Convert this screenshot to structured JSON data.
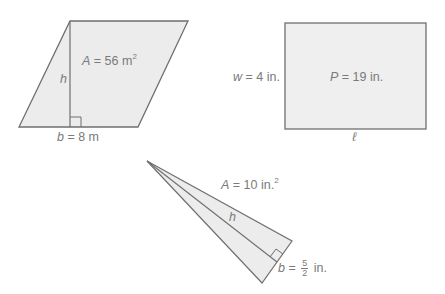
{
  "colors": {
    "fill": "#ececec",
    "stroke": "#6f6f6f",
    "text": "#7a7a7a",
    "background": "#ffffff"
  },
  "figures": {
    "parallelogram": {
      "shape": "parallelogram",
      "area_label": {
        "var": "A",
        "eq": " = 56 m",
        "sup": "2"
      },
      "height_label": "h",
      "base_label": {
        "var": "b",
        "eq": " = 8 m"
      }
    },
    "rectangle": {
      "shape": "rectangle",
      "perimeter_label": {
        "var": "P",
        "eq": " = 19 in."
      },
      "width_label": {
        "var": "w",
        "eq": " = 4 in."
      },
      "length_label": "ℓ"
    },
    "triangle": {
      "shape": "triangle",
      "area_label": {
        "var": "A",
        "eq": " = 10 in.",
        "sup": "2"
      },
      "height_label": "h",
      "base_label": {
        "var": "b",
        "eq": " = ",
        "num": "5",
        "den": "2",
        "unit": " in."
      }
    }
  }
}
